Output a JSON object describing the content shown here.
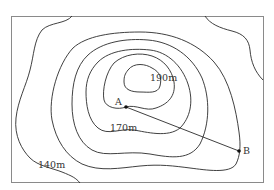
{
  "figure": {
    "type": "topographic-contour-map",
    "contour_interval_m": 10,
    "contour_labels": [
      {
        "id": "summit",
        "text": "190m",
        "x": 167,
        "y": 81
      },
      {
        "id": "mid",
        "text": "170m",
        "x": 122,
        "y": 131
      },
      {
        "id": "outer",
        "text": "140m",
        "x": 50,
        "y": 168
      }
    ],
    "points": [
      {
        "id": "A",
        "label": "A",
        "x": 126,
        "y": 107,
        "label_x": 115,
        "label_y": 105
      },
      {
        "id": "B",
        "label": "B",
        "x": 239,
        "y": 151,
        "label_x": 243,
        "label_y": 154
      }
    ],
    "segment": {
      "from": "A",
      "to": "B"
    },
    "colors": {
      "line": "#2a2a2a",
      "frame": "#8a8a8a",
      "background": "#ffffff"
    }
  }
}
